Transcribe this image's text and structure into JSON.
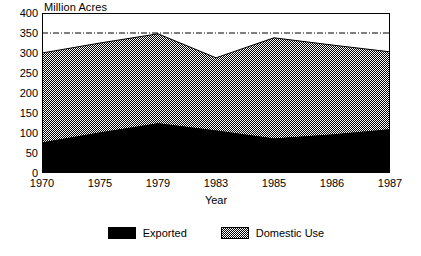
{
  "chart_data": {
    "type": "area",
    "stacked": true,
    "title": "",
    "ylabel": "Million Acres",
    "xlabel": "Year",
    "categories": [
      "1970",
      "1975",
      "1979",
      "1983",
      "1985",
      "1986",
      "1987"
    ],
    "series": [
      {
        "name": "Exported",
        "values": [
          75,
          100,
          123,
          105,
          85,
          95,
          108
        ],
        "color": "#000000",
        "fill": "solid-black"
      },
      {
        "name": "Domestic Use",
        "values": [
          225,
          225,
          225,
          183,
          253,
          225,
          195
        ],
        "color": "#808080",
        "fill": "checkered-gray"
      }
    ],
    "totals": [
      300,
      325,
      348,
      288,
      338,
      320,
      303
    ],
    "ylim": [
      0,
      400
    ],
    "yticks": [
      0,
      50,
      100,
      150,
      200,
      250,
      300,
      350,
      400
    ],
    "xticks": [
      "1970",
      "1975",
      "1979",
      "1983",
      "1985",
      "1986",
      "1987"
    ],
    "grid": false,
    "reference_line": {
      "value": 350,
      "style": "dash-dot"
    },
    "legend": {
      "position": "bottom",
      "entries": [
        {
          "label": "Exported",
          "swatch": "solid-black"
        },
        {
          "label": "Domestic Use",
          "swatch": "checkered-gray"
        }
      ]
    },
    "border": true
  }
}
